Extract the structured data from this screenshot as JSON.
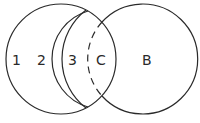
{
  "diagram": {
    "type": "venn-nested-arcs",
    "stroke_color": "#2a2a2a",
    "background": "#ffffff",
    "regions": [
      {
        "id": "region-1",
        "label": "1"
      },
      {
        "id": "region-2",
        "label": "2"
      },
      {
        "id": "region-3",
        "label": "3"
      },
      {
        "id": "region-c",
        "label": "C"
      },
      {
        "id": "region-b",
        "label": "B"
      }
    ]
  }
}
